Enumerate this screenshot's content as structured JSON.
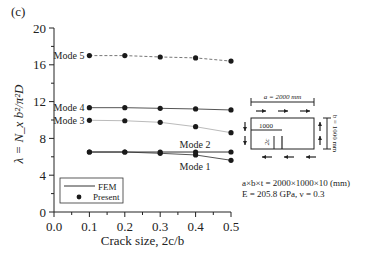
{
  "panel_label": "(c)",
  "chart_data": {
    "type": "line",
    "title": "",
    "xlabel": "Crack size, 2c/b",
    "ylabel": "λ = N_x b²/π²D",
    "x": [
      0.1,
      0.2,
      0.3,
      0.4,
      0.5
    ],
    "xlim": [
      0.0,
      0.5
    ],
    "ylim": [
      0,
      20
    ],
    "xticks": [
      "0.0",
      "0.1",
      "0.2",
      "0.3",
      "0.4",
      "0.5"
    ],
    "yticks": [
      "0",
      "4",
      "8",
      "12",
      "16",
      "20"
    ],
    "grid": false,
    "legend": {
      "position": "lower-left",
      "entries": [
        "FEM",
        "Present"
      ]
    },
    "series": [
      {
        "name": "Mode 1",
        "values": [
          6.52,
          6.52,
          6.38,
          6.2,
          5.62
        ],
        "line": "solid",
        "color": "#555555"
      },
      {
        "name": "Mode 2",
        "values": [
          6.52,
          6.52,
          6.52,
          6.52,
          6.52
        ],
        "line": "solid",
        "color": "#333333"
      },
      {
        "name": "Mode 3",
        "values": [
          9.97,
          9.92,
          9.75,
          9.27,
          8.62
        ],
        "line": "solid",
        "color": "#bbbbbb"
      },
      {
        "name": "Mode 4",
        "values": [
          11.34,
          11.34,
          11.27,
          11.2,
          11.09
        ],
        "line": "solid",
        "color": "#555555"
      },
      {
        "name": "Mode 5",
        "values": [
          17.0,
          17.0,
          16.85,
          16.75,
          16.4
        ],
        "line": "dashed",
        "color": "#777777"
      }
    ],
    "annotations": [
      "Mode 1",
      "Mode 2",
      "Mode 3",
      "Mode 4",
      "Mode 5"
    ]
  },
  "inset": {
    "width_label": "a = 2000 mm",
    "height_label": "b = 1000 mm",
    "crack_offset_label": "1000",
    "crack_label": "2c"
  },
  "parameters": {
    "line1": "a×b×t = 2000×1000×10 (mm)",
    "line2": "E = 205.8 GPa, ν = 0.3"
  }
}
